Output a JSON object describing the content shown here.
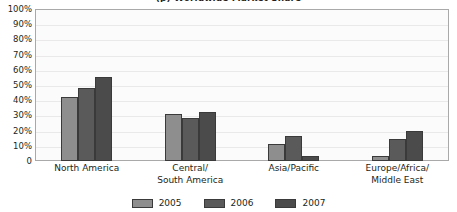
{
  "chart_data": {
    "type": "bar",
    "title": "(p) Worldwide Market Share",
    "xlabel": "",
    "ylabel": "",
    "ylim": [
      0,
      100
    ],
    "grid": true,
    "legend_position": "bottom",
    "categories": [
      "North America",
      "Central/\nSouth America",
      "Asia/Pacific",
      "Europe/Africa/\nMiddle East"
    ],
    "series": [
      {
        "name": "2005",
        "color": "#8e8e8e",
        "values": [
          42,
          31,
          11,
          3
        ]
      },
      {
        "name": "2006",
        "color": "#5a5a5a",
        "values": [
          48,
          28.5,
          16.5,
          14.5
        ]
      },
      {
        "name": "2007",
        "color": "#4b4b4b",
        "values": [
          55,
          32,
          3,
          20
        ]
      }
    ],
    "yticks": [
      "100%",
      "90%",
      "80%",
      "70%",
      "60%",
      "50%",
      "40%",
      "30%",
      "20%",
      "10%",
      "0"
    ],
    "ytick_values": [
      100,
      90,
      80,
      70,
      60,
      50,
      40,
      30,
      20,
      10,
      0
    ]
  },
  "colors": {
    "plot_background": "#fbfbfb",
    "plot_border": "#a9a9a9",
    "gridline": "#e9e9e9",
    "text": "#231f20",
    "bar_outline": "#3a3a3a"
  }
}
